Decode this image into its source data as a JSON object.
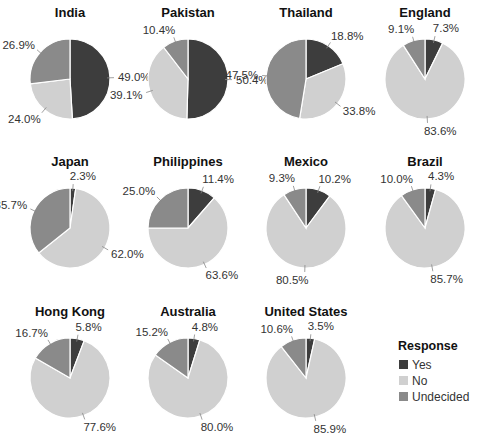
{
  "chart_data": {
    "type": "pie",
    "layout": "small-multiples 4x3 grid",
    "legend": {
      "title": "Response",
      "position": "bottom-right",
      "entries": [
        {
          "name": "Yes",
          "color": "#3d3d3d"
        },
        {
          "name": "No",
          "color": "#d0d0d0"
        },
        {
          "name": "Undecided",
          "color": "#8a8a8a"
        }
      ]
    },
    "categories": [
      "Yes",
      "No",
      "Undecided"
    ],
    "charts": [
      {
        "title": "India",
        "values": [
          49.0,
          24.0,
          26.9
        ],
        "labels": [
          "49.0%",
          "24.0%",
          "26.9%"
        ]
      },
      {
        "title": "Pakistan",
        "values": [
          50.4,
          39.1,
          10.4
        ],
        "labels": [
          "50.4%",
          "39.1%",
          "10.4%"
        ]
      },
      {
        "title": "Thailand",
        "values": [
          18.8,
          33.8,
          47.5
        ],
        "labels": [
          "18.8%",
          "33.8%",
          "47.5%"
        ]
      },
      {
        "title": "England",
        "values": [
          7.3,
          83.6,
          9.1
        ],
        "labels": [
          "7.3%",
          "83.6%",
          "9.1%"
        ]
      },
      {
        "title": "Japan",
        "values": [
          2.3,
          62.0,
          35.7
        ],
        "labels": [
          "2.3%",
          "62.0%",
          "35.7%"
        ]
      },
      {
        "title": "Philippines",
        "values": [
          11.4,
          63.6,
          25.0
        ],
        "labels": [
          "11.4%",
          "63.6%",
          "25.0%"
        ]
      },
      {
        "title": "Mexico",
        "values": [
          10.2,
          80.5,
          9.3
        ],
        "labels": [
          "10.2%",
          "80.5%",
          "9.3%"
        ]
      },
      {
        "title": "Brazil",
        "values": [
          4.3,
          85.7,
          10.0
        ],
        "labels": [
          "4.3%",
          "85.7%",
          "10.0%"
        ]
      },
      {
        "title": "Hong Kong",
        "values": [
          5.8,
          77.6,
          16.7
        ],
        "labels": [
          "5.8%",
          "77.6%",
          "16.7%"
        ]
      },
      {
        "title": "Australia",
        "values": [
          4.8,
          80.0,
          15.2
        ],
        "labels": [
          "4.8%",
          "80.0%",
          "15.2%"
        ]
      },
      {
        "title": "United States",
        "values": [
          3.5,
          85.9,
          10.6
        ],
        "labels": [
          "3.5%",
          "85.9%",
          "10.6%"
        ]
      }
    ]
  }
}
